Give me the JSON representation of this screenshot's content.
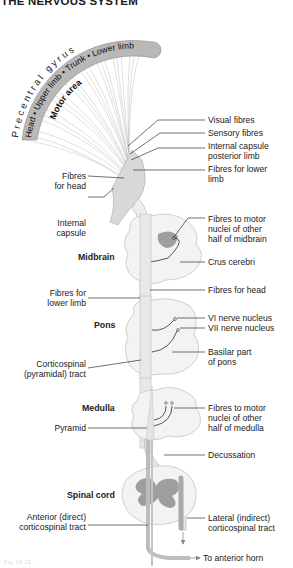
{
  "header": {
    "title": "THE NERVOUS SYSTEM"
  },
  "cortex": {
    "gyrus_label": "Precentral gyrus",
    "homunculus_label": "Head • Upper limb • Trunk • Lower limb",
    "area_label": "Motor area"
  },
  "regions": {
    "midbrain": "Midbrain",
    "pons": "Pons",
    "medulla": "Medulla",
    "spinal_cord": "Spinal cord"
  },
  "labels_right": [
    {
      "id": "visual",
      "lines": [
        "Visual fibres"
      ]
    },
    {
      "id": "sensory",
      "lines": [
        "Sensory fibres"
      ]
    },
    {
      "id": "ic-posterior",
      "lines": [
        "Internal capsule",
        "posterior limb"
      ]
    },
    {
      "id": "fibres-lower-limb-top",
      "lines": [
        "Fibres for lower",
        "limb"
      ]
    },
    {
      "id": "motor-nuclei-midbrain",
      "lines": [
        "Fibres to motor",
        "nuclei of other",
        "half of midbrain"
      ]
    },
    {
      "id": "crus-cerebri",
      "lines": [
        "Crus cerebri"
      ]
    },
    {
      "id": "fibres-head",
      "lines": [
        "Fibres for head"
      ]
    },
    {
      "id": "vi-nucleus",
      "lines": [
        "VI nerve nucleus"
      ]
    },
    {
      "id": "vii-nucleus",
      "lines": [
        "VII nerve nucleus"
      ]
    },
    {
      "id": "basilar-pons",
      "lines": [
        "Basilar part",
        "of pons"
      ]
    },
    {
      "id": "motor-nuclei-medulla",
      "lines": [
        "Fibres to motor",
        "nuclei of other",
        "half of medulla"
      ]
    },
    {
      "id": "decussation",
      "lines": [
        "Decussation"
      ]
    },
    {
      "id": "lateral-tract",
      "lines": [
        "Lateral (indirect)",
        "corticospinal tract"
      ]
    },
    {
      "id": "anterior-horn",
      "lines": [
        "To anterior horn"
      ]
    }
  ],
  "labels_left": [
    {
      "id": "fibres-head-left",
      "lines": [
        "Fibres",
        "for head"
      ]
    },
    {
      "id": "internal-capsule",
      "lines": [
        "Internal",
        "capsule"
      ]
    },
    {
      "id": "fibres-lower-limb-left",
      "lines": [
        "Fibres for",
        "lower limb"
      ]
    },
    {
      "id": "corticospinal",
      "lines": [
        "Corticospinal",
        "(pyramidal) tract"
      ]
    },
    {
      "id": "pyramid",
      "lines": [
        "Pyramid"
      ]
    },
    {
      "id": "anterior-tract",
      "lines": [
        "Anterior (direct)",
        "corticospinal tract"
      ]
    }
  ],
  "colors": {
    "gyrus_band": "#b5b5b5",
    "fibres": "#9a9a9a",
    "tissue": "#f2f2f2",
    "tissue_edge": "#c8c8c8",
    "grey_matter": "#9d9d9d",
    "leader": "#333333"
  },
  "caption": "Fig. 14.13 ..."
}
